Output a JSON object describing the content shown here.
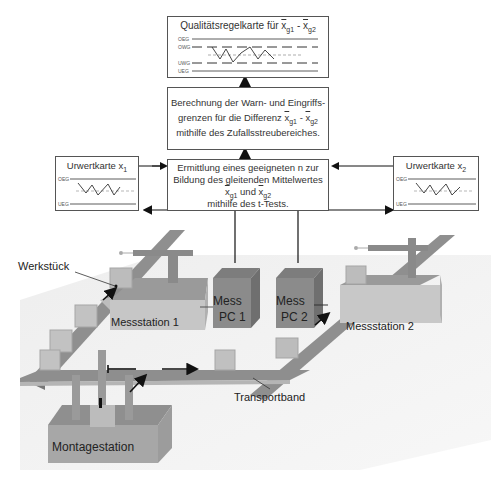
{
  "top_box": {
    "title": "Qualitätsregelkarte für",
    "var1": "x",
    "sub1": "g1",
    "minus": " - ",
    "var2": "x",
    "sub2": "g2",
    "limits": [
      "OEG",
      "OWG",
      "UWG",
      "UEG"
    ]
  },
  "middle_box": {
    "line1": "Berechnung der Warn- und Eingriffs-",
    "line2_pre": "grenzen für die Differenz",
    "var1": "x",
    "sub1": "g1",
    "minus": " - ",
    "var2": "x",
    "sub2": "g2",
    "line3": "mithilfe des Zufallsstreubereiches."
  },
  "lower_box": {
    "line1": "Ermittlung eines geeigneten n zur",
    "line2": "Bildung des gleitenden Mittelwertes",
    "var1": "x",
    "sub1": "g1",
    "und": " und ",
    "var2": "x",
    "sub2": "g2",
    "line4": "mithilfe des t-Tests."
  },
  "left_card": {
    "title": "Urwertkarte x",
    "sub": "1",
    "oeg": "OEG",
    "ueg": "UEG"
  },
  "right_card": {
    "title": "Urwertkarte x",
    "sub": "2",
    "oeg": "OEG",
    "ueg": "UEG"
  },
  "labels": {
    "werkstueck": "Werkstück",
    "messstation1": "Messstation 1",
    "messstation2": "Messstation 2",
    "messpc1_line1": "Mess",
    "messpc1_line2": "PC 1",
    "messpc2_line1": "Mess",
    "messpc2_line2": "PC 2",
    "transportband": "Transportband",
    "montagestation": "Montagestation"
  }
}
